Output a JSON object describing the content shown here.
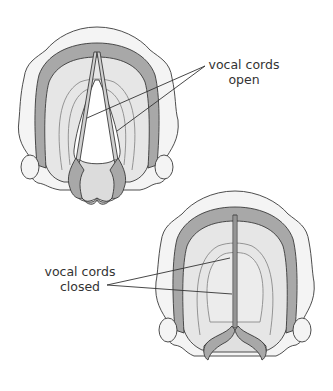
{
  "figures": [
    {
      "id": "open",
      "label_line1": "vocal cords",
      "label_line2": "open"
    },
    {
      "id": "closed",
      "label_line1": "vocal cords",
      "label_line2": "closed"
    }
  ],
  "colors": {
    "outline": "#3a3a3a",
    "outer_tissue": "#f4f4f4",
    "band": "#a8a8a8",
    "inner_tissue": "#dcdcdc",
    "inner_light": "#e9e9e9",
    "opening": "#ffffff",
    "text": "#333333"
  }
}
